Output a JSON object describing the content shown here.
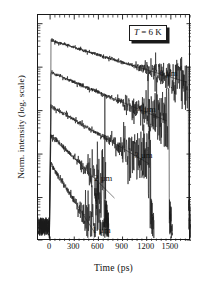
{
  "figure": {
    "background": "#ffffff",
    "frame_color": "#1a1a1a",
    "annotation": {
      "symbol": "T",
      "text": " = 6 K",
      "full_text": "T = 6 K"
    }
  },
  "chart_data": {
    "type": "line",
    "title": "",
    "subtitle": "",
    "xlabel": "Time (ps)",
    "ylabel": "Norm. intensity (log. scale)",
    "xlim": [
      -150,
      1750
    ],
    "ylim_decades": [
      0,
      5.2
    ],
    "yscale": "log",
    "y_tick_labels": [],
    "xtick_labels": [
      "0",
      "300",
      "600",
      "900",
      "1200",
      "1500"
    ],
    "xticks": [
      0,
      300,
      600,
      900,
      1200,
      1500
    ],
    "xtick_minor_step": 60,
    "grid": false,
    "legend": "inline-right-labels",
    "annotations": [
      "T = 6 K"
    ],
    "series": [
      {
        "name": "6 µm",
        "label": "6 µm",
        "label_x_ps": 1370,
        "offset_decades": 4.62,
        "peak_time_ps": 10,
        "rise_time_ps": 55,
        "decay_constant_ps": 760,
        "t_end_ps": 1720,
        "noise_onset_ps": 900,
        "noise_amplitude": 0.22,
        "fit_line": {
          "t0_ps": 60,
          "t1_ps": 1700,
          "decay_constant_ps": 760
        }
      },
      {
        "name": "4 µm",
        "label": "4 µm",
        "label_x_ps": 1100,
        "offset_decades": 3.88,
        "peak_time_ps": 10,
        "rise_time_ps": 50,
        "decay_constant_ps": 560,
        "t_end_ps": 1480,
        "noise_onset_ps": 700,
        "noise_amplitude": 0.26,
        "fit_line": {
          "t0_ps": 55,
          "t1_ps": 1450,
          "decay_constant_ps": 560
        }
      },
      {
        "name": "3 µm",
        "label": "3 µm",
        "label_x_ps": 1060,
        "offset_decades": 3.1,
        "peak_time_ps": 10,
        "rise_time_ps": 45,
        "decay_constant_ps": 400,
        "t_end_ps": 1250,
        "noise_onset_ps": 560,
        "noise_amplitude": 0.3,
        "fit_line": {
          "t0_ps": 50,
          "t1_ps": 1230,
          "decay_constant_ps": 400
        }
      },
      {
        "name": "2 µm",
        "label": "2 µm",
        "label_x_ps": 560,
        "offset_decades": 2.45,
        "peak_time_ps": 8,
        "rise_time_ps": 35,
        "decay_constant_ps": 235,
        "t_end_ps": 690,
        "noise_onset_ps": 330,
        "noise_amplitude": 0.36,
        "fit_line": {
          "t0_ps": 40,
          "t1_ps": 800,
          "decay_constant_ps": 235
        }
      },
      {
        "name": "1 µm",
        "label": "1 µm",
        "label_x_ps": 540,
        "offset_decades": 1.78,
        "peak_time_ps": 6,
        "rise_time_ps": 25,
        "decay_constant_ps": 150,
        "t_end_ps": 680,
        "noise_onset_ps": 230,
        "noise_amplitude": 0.42,
        "fit_line": {
          "t0_ps": 30,
          "t1_ps": 560,
          "decay_constant_ps": 150
        }
      }
    ]
  }
}
